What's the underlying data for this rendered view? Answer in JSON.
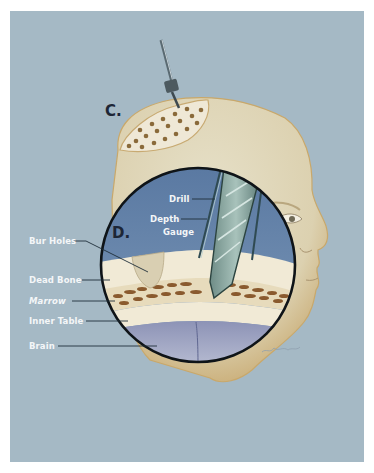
{
  "figure": {
    "panel_labels": {
      "c": "C.",
      "d": "D."
    },
    "callouts": {
      "drill": "Drill",
      "depth_gauge_line1": "Depth",
      "depth_gauge_line2": "Gauge",
      "bur_holes": "Bur Holes",
      "dead_bone": "Dead Bone",
      "marrow": "Marrow",
      "inner_table": "Inner Table",
      "brain": "Brain"
    },
    "colors": {
      "background": "#a5b9c5",
      "skin": "#ddd3b4",
      "skin_edge": "#c9a86a",
      "inset_sky": "#5f7fa6",
      "bone": "#f1ead6",
      "marrow": "#8a5a2e",
      "brain": "#a9aec9",
      "label_text": "#f4f6f8",
      "letter_text": "#1d2636"
    }
  }
}
